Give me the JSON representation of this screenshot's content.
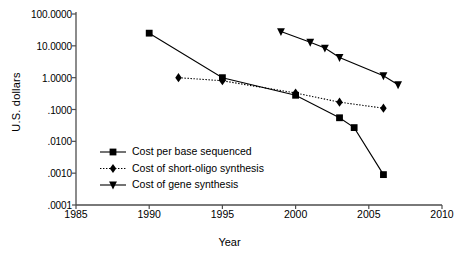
{
  "chart_data": {
    "type": "line",
    "title": "",
    "xlabel": "Year",
    "ylabel": "U.S. dollars",
    "xlim": [
      1985,
      2010
    ],
    "ylim": [
      0.0001,
      100
    ],
    "yscale": "log",
    "grid": false,
    "legend_position": "inside-lower-left",
    "xticks": [
      "1985",
      "1990",
      "1995",
      "2000",
      "2005",
      "2010"
    ],
    "xtick_values": [
      1985,
      1990,
      1995,
      2000,
      2005,
      2010
    ],
    "yticks": [
      "100.0000",
      "10.0000",
      "1.0000",
      ".1000",
      ".0100",
      ".0010",
      ".0001"
    ],
    "ytick_values": [
      100,
      10,
      1,
      0.1,
      0.01,
      0.001,
      0.0001
    ],
    "series": [
      {
        "name": "Cost per base sequenced",
        "marker": "square",
        "linestyle": "solid",
        "color": "#000000",
        "x": [
          1990,
          1995,
          2000,
          2003,
          2004,
          2006
        ],
        "y": [
          25.0,
          1.0,
          0.28,
          0.055,
          0.027,
          0.0009
        ]
      },
      {
        "name": "Cost of short-oligo synthesis",
        "marker": "diamond",
        "linestyle": "dotted",
        "color": "#000000",
        "x": [
          1992,
          1995,
          2000,
          2003,
          2006
        ],
        "y": [
          1.0,
          0.8,
          0.33,
          0.17,
          0.11
        ]
      },
      {
        "name": "Cost of gene synthesis",
        "marker": "triangle-down",
        "linestyle": "solid",
        "color": "#000000",
        "x": [
          1999,
          2001,
          2002,
          2003,
          2006,
          2007
        ],
        "y": [
          28.0,
          13.0,
          8.5,
          4.3,
          1.15,
          0.6
        ]
      }
    ]
  },
  "axis": {
    "ylabel": "U.S. dollars",
    "xlabel": "Year"
  },
  "legend": {
    "items": [
      {
        "label": "Cost per base sequenced"
      },
      {
        "label": "Cost of short-oligo synthesis"
      },
      {
        "label": "Cost of gene synthesis"
      }
    ]
  }
}
